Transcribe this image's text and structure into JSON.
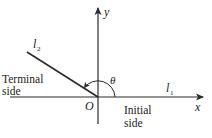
{
  "diagram": {
    "type": "angle-in-standard-position",
    "axes": {
      "x_label": "x",
      "y_label": "y",
      "origin_label": "O"
    },
    "rays": {
      "initial": {
        "name": "l",
        "subscript": "1",
        "side_label_line1": "Initial",
        "side_label_line2": "side"
      },
      "terminal": {
        "name": "l",
        "subscript": "2",
        "side_label_line1": "Terminal",
        "side_label_line2": "side"
      }
    },
    "angle": {
      "label": "θ",
      "approx_degrees": 148
    },
    "colors": {
      "line": "#2a2a2a",
      "text": "#222222",
      "background": "#ffffff"
    }
  }
}
